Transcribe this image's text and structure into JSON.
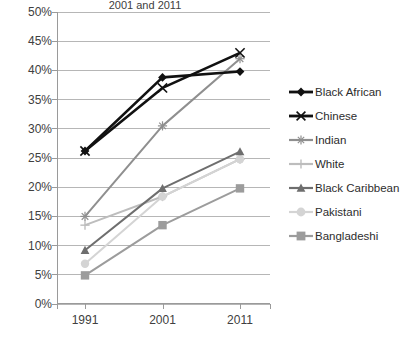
{
  "chart_data": {
    "type": "line",
    "title": "2001 and 2011",
    "xlabel": "",
    "ylabel": "",
    "categories": [
      "1991",
      "2001",
      "2011"
    ],
    "x": [
      1991,
      2001,
      2011
    ],
    "ylim": [
      0,
      50
    ],
    "ytick_labels": [
      "0%",
      "5%",
      "10%",
      "15%",
      "20%",
      "25%",
      "30%",
      "35%",
      "40%",
      "45%",
      "50%"
    ],
    "ytick_values": [
      0,
      5,
      10,
      15,
      20,
      25,
      30,
      35,
      40,
      45,
      50
    ],
    "grid": true,
    "legend_position": "right",
    "series": [
      {
        "name": "Black African",
        "values": [
          26.2,
          38.8,
          39.8
        ],
        "color": "#111111",
        "marker": "diamond"
      },
      {
        "name": "Chinese",
        "values": [
          26.2,
          37.0,
          43.0
        ],
        "color": "#111111",
        "marker": "x"
      },
      {
        "name": "Indian",
        "values": [
          15.0,
          30.5,
          42.0
        ],
        "color": "#8f8f8f",
        "marker": "asterisk"
      },
      {
        "name": "White",
        "values": [
          13.5,
          18.4,
          24.8
        ],
        "color": "#bdbdbd",
        "marker": "plus"
      },
      {
        "name": "Black Caribbean",
        "values": [
          9.2,
          19.8,
          26.1
        ],
        "color": "#6e6e6e",
        "marker": "triangle"
      },
      {
        "name": "Pakistani",
        "values": [
          6.9,
          18.4,
          24.8
        ],
        "color": "#d4d4d4",
        "marker": "circle"
      },
      {
        "name": "Bangladeshi",
        "values": [
          4.9,
          13.5,
          19.8
        ],
        "color": "#9c9c9c",
        "marker": "square"
      }
    ]
  },
  "legend": {
    "items": [
      {
        "label": "Black African"
      },
      {
        "label": "Chinese"
      },
      {
        "label": "Indian"
      },
      {
        "label": "White"
      },
      {
        "label": "Black Caribbean"
      },
      {
        "label": "Pakistani"
      },
      {
        "label": "Bangladeshi"
      }
    ]
  },
  "axes": {
    "y_labels": [
      "50%",
      "45%",
      "40%",
      "35%",
      "30%",
      "25%",
      "20%",
      "15%",
      "10%",
      "5%",
      "0%"
    ],
    "x_labels": [
      "1991",
      "2001",
      "2011"
    ]
  }
}
